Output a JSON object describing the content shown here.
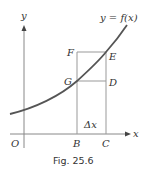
{
  "figure": {
    "caption": "Fig. 25.6",
    "curve_label": "y = f(x)",
    "axes": {
      "x_label": "x",
      "y_label": "y",
      "origin_label": "O"
    },
    "points": {
      "F": "F",
      "E": "E",
      "G": "G",
      "D": "D",
      "B": "B",
      "C": "C"
    },
    "delta_label": "Δx",
    "colors": {
      "curve": "#555555",
      "lines": "#888888",
      "text": "#333333"
    }
  }
}
